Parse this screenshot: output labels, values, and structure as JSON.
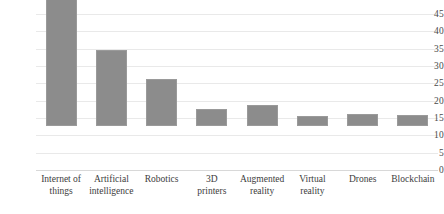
{
  "chart_data": {
    "type": "bar",
    "title": "",
    "subtitle": "",
    "xlabel": "",
    "ylabel": "",
    "ylim": [
      0,
      45
    ],
    "yticks": [
      0,
      5,
      10,
      15,
      20,
      25,
      30,
      35,
      40,
      45
    ],
    "ytick_labels": [
      "0",
      "5",
      "10",
      "15",
      "20",
      "25",
      "30",
      "35",
      "40",
      "45"
    ],
    "grid": true,
    "legend": false,
    "legend_position": "none",
    "bar_color": "#8c8c8c",
    "categories": [
      "Internet of things",
      "Artificial intelligence",
      "Robotics",
      "3D printers",
      "Augmented reality",
      "Virtual reality",
      "Drones",
      "Blockchain"
    ],
    "category_lines": [
      [
        "Internet of",
        "things"
      ],
      [
        "Artificial",
        "intelligence"
      ],
      [
        "Robotics"
      ],
      [
        "3D",
        "printers"
      ],
      [
        "Augmented",
        "reality"
      ],
      [
        "Virtual",
        "reality"
      ],
      [
        "Drones"
      ],
      [
        "Blockchain"
      ]
    ],
    "values": [
      42,
      22,
      13.5,
      5,
      6,
      3,
      3.5,
      3.2
    ]
  }
}
